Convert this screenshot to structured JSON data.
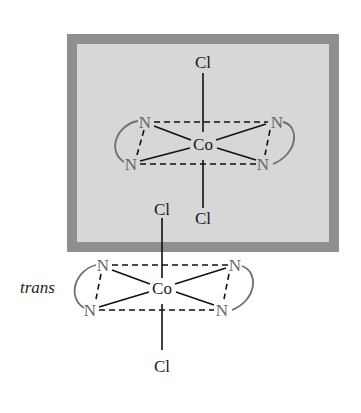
{
  "highlight_box": {
    "border_color": "#8f8f8f",
    "fill_color": "#d7d7d7"
  },
  "top_complex": {
    "metal": "Co",
    "axial_top": "Cl",
    "axial_bottom": "Cl",
    "ligand_atoms": [
      "N",
      "N",
      "N",
      "N"
    ]
  },
  "bottom_complex": {
    "metal": "Co",
    "axial_top": "Cl",
    "axial_bottom": "Cl",
    "ligand_atoms": [
      "N",
      "N",
      "N",
      "N"
    ],
    "isomer_label": "trans"
  }
}
